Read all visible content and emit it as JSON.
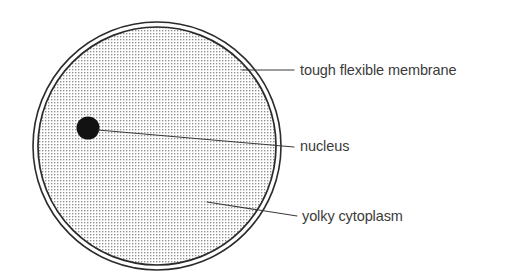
{
  "figure": {
    "background_color": "#ffffff",
    "width": 527,
    "height": 275
  },
  "cell": {
    "name": "egg-cell",
    "center_x": 157,
    "center_y": 146,
    "outer_radius": 124,
    "inner_radius": 119,
    "outline_color": "#2b2b2b",
    "fill_description": "stippled dot texture",
    "stipple_color": "#8f8f8f",
    "stipple_pitch": 3
  },
  "nucleus": {
    "name": "nucleus",
    "center_x": 88,
    "center_y": 128,
    "radius": 11.5,
    "fill_color": "#121212"
  },
  "labels": [
    {
      "id": "membrane",
      "text": "tough flexible membrane",
      "text_x": 300,
      "text_y": 71,
      "leader": {
        "x1": 242,
        "y1": 70,
        "x2": 294,
        "y2": 70
      }
    },
    {
      "id": "nucleus",
      "text": "nucleus",
      "text_x": 300,
      "text_y": 147,
      "leader": {
        "x1": 98,
        "y1": 130,
        "x2": 294,
        "y2": 147
      }
    },
    {
      "id": "cytoplasm",
      "text": "yolky cytoplasm",
      "text_x": 302,
      "text_y": 217,
      "leader": {
        "x1": 207,
        "y1": 202,
        "x2": 297,
        "y2": 216
      }
    }
  ],
  "style": {
    "leader_color": "#3a3a3a",
    "leader_width": 1.1,
    "text_color": "#3b3b3b"
  }
}
